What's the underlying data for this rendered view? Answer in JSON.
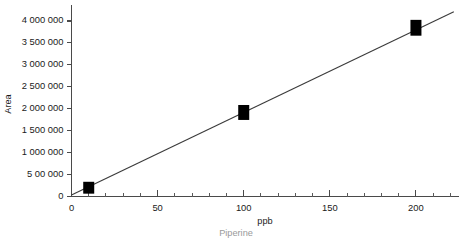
{
  "chart_data": {
    "type": "scatter",
    "title": "",
    "subtitle": "",
    "xlabel": "ppb",
    "ylabel": "Area",
    "series_caption": "Piperine",
    "xlim": [
      0,
      225
    ],
    "ylim": [
      0,
      4250000
    ],
    "grid": false,
    "legend_position": "none",
    "x_major_ticks": [
      0,
      50,
      100,
      150,
      200
    ],
    "x_major_tick_labels": [
      "0",
      "50",
      "100",
      "150",
      "200"
    ],
    "x_minor_tick_interval": 10,
    "y_major_ticks": [
      0,
      500000,
      1000000,
      1500000,
      2000000,
      2500000,
      3000000,
      3500000,
      4000000
    ],
    "y_major_tick_labels": [
      "0",
      "5 00 000",
      "1 000 000",
      "1 500 000",
      "2 000 000",
      "2 500 000",
      "3 000 000",
      "3 500 000",
      "4 000 000"
    ],
    "series": [
      {
        "name": "Piperine",
        "marker": "filled-square",
        "color": "#000000",
        "points": [
          {
            "x": 10,
            "y": 190000
          },
          {
            "x": 10,
            "y": 210000
          },
          {
            "x": 100,
            "y": 1870000
          },
          {
            "x": 100,
            "y": 1960000
          },
          {
            "x": 200,
            "y": 3790000
          },
          {
            "x": 200,
            "y": 3900000
          }
        ]
      }
    ],
    "fit_line": {
      "name": "linear-regression",
      "color": "#3b3b3b",
      "x_start": 0,
      "y_start": 35000,
      "x_end": 222,
      "y_end": 4210000
    }
  }
}
